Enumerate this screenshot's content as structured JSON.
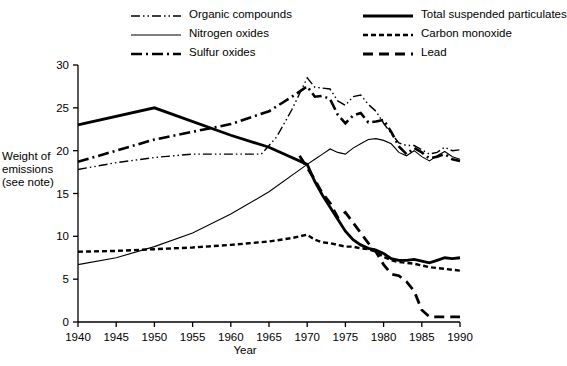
{
  "chart_data": {
    "type": "line",
    "title": "",
    "xlabel": "Year",
    "ylabel": "Weight of emissions (see note)",
    "xlim": [
      1940,
      1990
    ],
    "ylim": [
      0,
      30
    ],
    "xticks": [
      1940,
      1945,
      1950,
      1955,
      1960,
      1965,
      1970,
      1975,
      1980,
      1985,
      1990
    ],
    "yticks": [
      0,
      5,
      10,
      15,
      20,
      25,
      30
    ],
    "grid": false,
    "legend_position": "top",
    "series": [
      {
        "name": "Organic compounds",
        "style": "dash-dot-dot",
        "color": "#000000",
        "width": 1.4,
        "points": [
          [
            1940,
            17.8
          ],
          [
            1945,
            18.6
          ],
          [
            1950,
            19.2
          ],
          [
            1955,
            19.6
          ],
          [
            1960,
            19.6
          ],
          [
            1962,
            19.6
          ],
          [
            1964,
            19.6
          ],
          [
            1966,
            21.6
          ],
          [
            1968,
            24.8
          ],
          [
            1970,
            28.5
          ],
          [
            1971,
            27.4
          ],
          [
            1972,
            27.3
          ],
          [
            1973,
            27.2
          ],
          [
            1974,
            25.8
          ],
          [
            1975,
            25.3
          ],
          [
            1976,
            26.3
          ],
          [
            1977,
            26.5
          ],
          [
            1978,
            25.4
          ],
          [
            1979,
            24.6
          ],
          [
            1980,
            23.2
          ],
          [
            1981,
            22.0
          ],
          [
            1982,
            20.9
          ],
          [
            1983,
            20.6
          ],
          [
            1984,
            20.6
          ],
          [
            1985,
            20.1
          ],
          [
            1986,
            19.6
          ],
          [
            1987,
            19.8
          ],
          [
            1988,
            20.4
          ],
          [
            1989,
            20.0
          ],
          [
            1990,
            20.1
          ]
        ]
      },
      {
        "name": "Nitrogen oxides",
        "style": "solid-thin",
        "color": "#000000",
        "width": 1.1,
        "points": [
          [
            1940,
            6.7
          ],
          [
            1945,
            7.5
          ],
          [
            1950,
            8.8
          ],
          [
            1955,
            10.4
          ],
          [
            1960,
            12.6
          ],
          [
            1965,
            15.2
          ],
          [
            1970,
            18.4
          ],
          [
            1971,
            19.0
          ],
          [
            1972,
            19.6
          ],
          [
            1973,
            20.2
          ],
          [
            1974,
            19.8
          ],
          [
            1975,
            19.6
          ],
          [
            1976,
            20.3
          ],
          [
            1977,
            20.8
          ],
          [
            1978,
            21.3
          ],
          [
            1979,
            21.4
          ],
          [
            1980,
            21.2
          ],
          [
            1981,
            20.8
          ],
          [
            1982,
            19.8
          ],
          [
            1983,
            19.4
          ],
          [
            1984,
            20.0
          ],
          [
            1985,
            19.3
          ],
          [
            1986,
            18.8
          ],
          [
            1987,
            19.4
          ],
          [
            1988,
            19.9
          ],
          [
            1989,
            19.3
          ],
          [
            1990,
            19.0
          ]
        ]
      },
      {
        "name": "Sulfur oxides",
        "style": "dash-dot",
        "color": "#000000",
        "width": 2.6,
        "points": [
          [
            1940,
            18.7
          ],
          [
            1945,
            20.0
          ],
          [
            1950,
            21.3
          ],
          [
            1955,
            22.2
          ],
          [
            1960,
            23.1
          ],
          [
            1965,
            24.6
          ],
          [
            1968,
            26.3
          ],
          [
            1970,
            27.5
          ],
          [
            1971,
            26.3
          ],
          [
            1972,
            26.4
          ],
          [
            1973,
            26.0
          ],
          [
            1974,
            24.2
          ],
          [
            1975,
            23.2
          ],
          [
            1976,
            24.1
          ],
          [
            1977,
            24.4
          ],
          [
            1978,
            23.3
          ],
          [
            1979,
            23.4
          ],
          [
            1980,
            23.6
          ],
          [
            1981,
            22.2
          ],
          [
            1982,
            20.5
          ],
          [
            1983,
            19.6
          ],
          [
            1984,
            20.3
          ],
          [
            1985,
            19.8
          ],
          [
            1986,
            19.1
          ],
          [
            1987,
            19.3
          ],
          [
            1988,
            19.6
          ],
          [
            1989,
            19.0
          ],
          [
            1990,
            18.8
          ]
        ]
      },
      {
        "name": "Total suspended particulates",
        "style": "solid-thick",
        "color": "#000000",
        "width": 2.8,
        "points": [
          [
            1940,
            23.0
          ],
          [
            1950,
            25.0
          ],
          [
            1960,
            21.8
          ],
          [
            1965,
            20.4
          ],
          [
            1970,
            18.4
          ],
          [
            1971,
            16.4
          ],
          [
            1972,
            14.8
          ],
          [
            1973,
            13.4
          ],
          [
            1974,
            12.0
          ],
          [
            1975,
            10.6
          ],
          [
            1976,
            9.6
          ],
          [
            1977,
            9.0
          ],
          [
            1978,
            8.6
          ],
          [
            1979,
            8.4
          ],
          [
            1980,
            8.0
          ],
          [
            1981,
            7.4
          ],
          [
            1982,
            7.2
          ],
          [
            1983,
            7.2
          ],
          [
            1984,
            7.3
          ],
          [
            1985,
            7.1
          ],
          [
            1986,
            6.9
          ],
          [
            1987,
            7.2
          ],
          [
            1988,
            7.5
          ],
          [
            1989,
            7.4
          ],
          [
            1990,
            7.5
          ]
        ]
      },
      {
        "name": "Carbon monoxide",
        "style": "dotted-dash",
        "color": "#000000",
        "width": 2.4,
        "points": [
          [
            1940,
            8.2
          ],
          [
            1945,
            8.3
          ],
          [
            1950,
            8.5
          ],
          [
            1955,
            8.7
          ],
          [
            1960,
            9.0
          ],
          [
            1965,
            9.4
          ],
          [
            1968,
            9.8
          ],
          [
            1970,
            10.2
          ],
          [
            1971,
            9.6
          ],
          [
            1972,
            9.3
          ],
          [
            1973,
            9.2
          ],
          [
            1974,
            9.0
          ],
          [
            1975,
            8.8
          ],
          [
            1976,
            8.8
          ],
          [
            1977,
            8.6
          ],
          [
            1978,
            8.5
          ],
          [
            1979,
            8.2
          ],
          [
            1980,
            7.6
          ],
          [
            1981,
            7.2
          ],
          [
            1982,
            7.0
          ],
          [
            1983,
            6.9
          ],
          [
            1984,
            6.8
          ],
          [
            1985,
            6.6
          ],
          [
            1986,
            6.4
          ],
          [
            1987,
            6.3
          ],
          [
            1988,
            6.2
          ],
          [
            1989,
            6.1
          ],
          [
            1990,
            6.0
          ]
        ]
      },
      {
        "name": "Lead",
        "style": "long-dash",
        "color": "#000000",
        "width": 2.8,
        "points": [
          [
            1969,
            19.4
          ],
          [
            1971,
            16.6
          ],
          [
            1972,
            15.0
          ],
          [
            1973,
            13.9
          ],
          [
            1974,
            12.2
          ],
          [
            1975,
            12.8
          ],
          [
            1976,
            11.6
          ],
          [
            1977,
            10.4
          ],
          [
            1978,
            9.2
          ],
          [
            1979,
            8.2
          ],
          [
            1980,
            6.7
          ],
          [
            1981,
            5.6
          ],
          [
            1982,
            5.4
          ],
          [
            1983,
            4.7
          ],
          [
            1984,
            3.6
          ],
          [
            1985,
            1.4
          ],
          [
            1986,
            0.6
          ],
          [
            1987,
            0.6
          ],
          [
            1988,
            0.6
          ],
          [
            1989,
            0.6
          ],
          [
            1990,
            0.6
          ]
        ]
      }
    ]
  },
  "legend": {
    "left_column": [
      {
        "label": "Organic compounds",
        "sample": "dash-dot-dot"
      },
      {
        "label": "Nitrogen oxides",
        "sample": "solid-thin"
      },
      {
        "label": "Sulfur oxides",
        "sample": "dash-dot"
      }
    ],
    "right_column": [
      {
        "label": "Total suspended particulates",
        "sample": "solid-thick"
      },
      {
        "label": "Carbon monoxide",
        "sample": "dotted-dash"
      },
      {
        "label": "Lead",
        "sample": "long-dash"
      }
    ]
  },
  "axis": {
    "y_title": "Weight of emissions (see note)",
    "x_title": "Year"
  }
}
